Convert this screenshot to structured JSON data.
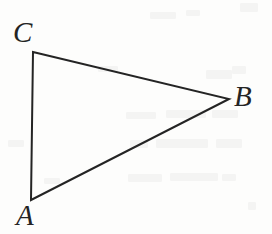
{
  "figure": {
    "kind": "geometry-diagram",
    "shape": "triangle",
    "background_color": "#fdfdfc",
    "ink_color": "#242424",
    "stroke_width_px": 2,
    "canvas": {
      "width": 272,
      "height": 234
    },
    "vertices": [
      {
        "name": "C",
        "label": "C",
        "x": 33,
        "y": 52,
        "label_x": 13,
        "label_y": 18
      },
      {
        "name": "A",
        "label": "A",
        "x": 31,
        "y": 200,
        "label_x": 16,
        "label_y": 201
      },
      {
        "name": "B",
        "label": "B",
        "x": 229,
        "y": 99,
        "label_x": 234,
        "label_y": 82
      }
    ],
    "edges": [
      {
        "name": "edge-CA",
        "from": "C",
        "to": "A"
      },
      {
        "name": "edge-CB",
        "from": "C",
        "to": "B"
      },
      {
        "name": "edge-AB",
        "from": "A",
        "to": "B"
      }
    ],
    "polygon_points": "33,52 229,99 31,200",
    "bleed_marks": [
      {
        "x": 150,
        "y": 12,
        "w": 26,
        "h": 7
      },
      {
        "x": 186,
        "y": 10,
        "w": 14,
        "h": 6
      },
      {
        "x": 240,
        "y": 3,
        "w": 18,
        "h": 9
      },
      {
        "x": 98,
        "y": 66,
        "w": 20,
        "h": 6
      },
      {
        "x": 206,
        "y": 70,
        "w": 26,
        "h": 9
      },
      {
        "x": 232,
        "y": 66,
        "w": 14,
        "h": 8
      },
      {
        "x": 126,
        "y": 112,
        "w": 30,
        "h": 7
      },
      {
        "x": 166,
        "y": 110,
        "w": 40,
        "h": 8
      },
      {
        "x": 212,
        "y": 110,
        "w": 26,
        "h": 8
      },
      {
        "x": 130,
        "y": 140,
        "w": 18,
        "h": 8
      },
      {
        "x": 156,
        "y": 139,
        "w": 52,
        "h": 9
      },
      {
        "x": 216,
        "y": 139,
        "w": 26,
        "h": 9
      },
      {
        "x": 8,
        "y": 140,
        "w": 16,
        "h": 7
      },
      {
        "x": 128,
        "y": 174,
        "w": 34,
        "h": 8
      },
      {
        "x": 170,
        "y": 173,
        "w": 48,
        "h": 8
      },
      {
        "x": 222,
        "y": 174,
        "w": 14,
        "h": 7
      },
      {
        "x": 44,
        "y": 178,
        "w": 16,
        "h": 6
      },
      {
        "x": 248,
        "y": 202,
        "w": 8,
        "h": 8
      }
    ]
  }
}
